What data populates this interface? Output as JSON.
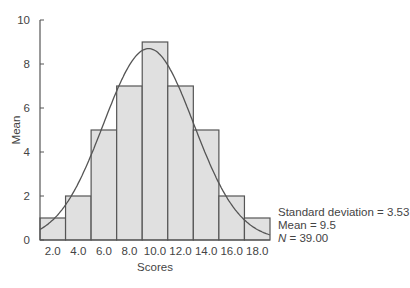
{
  "chart_data": {
    "type": "bar",
    "subtype": "histogram_with_normal_curve",
    "title": "",
    "xlabel": "Scores",
    "ylabel": "Mean",
    "categories": [
      "2.0",
      "4.0",
      "6.0",
      "8.0",
      "10.0",
      "12.0",
      "14.0",
      "16.0",
      "18.0"
    ],
    "bins": [
      {
        "from": 1,
        "to": 3,
        "value": 1
      },
      {
        "from": 3,
        "to": 5,
        "value": 2
      },
      {
        "from": 5,
        "to": 7,
        "value": 5
      },
      {
        "from": 7,
        "to": 9,
        "value": 7
      },
      {
        "from": 9,
        "to": 11,
        "value": 9
      },
      {
        "from": 11,
        "to": 13,
        "value": 7
      },
      {
        "from": 13,
        "to": 15,
        "value": 5
      },
      {
        "from": 15,
        "to": 17,
        "value": 2
      },
      {
        "from": 17,
        "to": 19,
        "value": 1
      }
    ],
    "values": [
      1,
      2,
      5,
      7,
      9,
      7,
      5,
      2,
      1
    ],
    "yticks": [
      "0",
      "2",
      "4",
      "6",
      "8",
      "10"
    ],
    "ylim": [
      0,
      10
    ],
    "xlim": [
      1,
      19
    ],
    "grid": false,
    "normal_curve": {
      "mean": 9.5,
      "sd": 3.53,
      "peak_approx": 8.7
    },
    "annotations": [
      "Standard deviation = 3.53",
      "Mean = 9.5",
      "N = 39.00"
    ],
    "colors": {
      "bar_fill": "#e0e0e0",
      "bar_edge": "#555555",
      "curve": "#555555",
      "axis": "#555555"
    }
  },
  "stats": {
    "sd_label": "Standard deviation = 3.53",
    "mean_label": "Mean = 9.5",
    "n_italic": "N",
    "n_value": " = 39.00"
  }
}
